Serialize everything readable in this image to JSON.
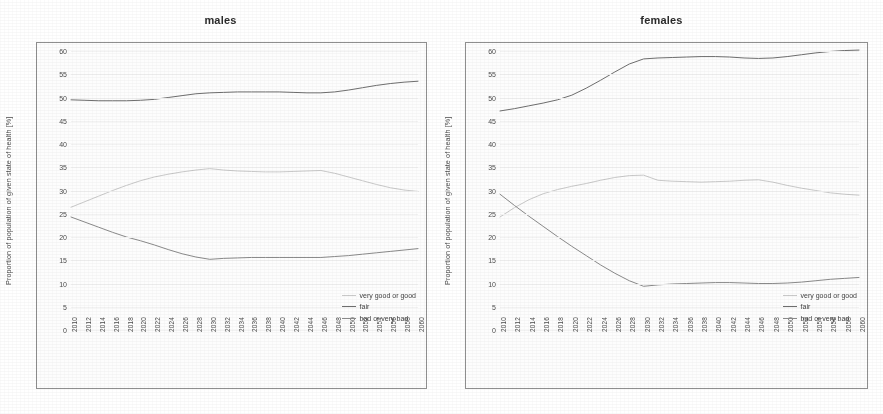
{
  "figure": {
    "background": "#ffffff",
    "panel_count": 2
  },
  "axis": {
    "ylabel": "Proportion of population of given state of health [%]",
    "yticks": [
      0,
      5,
      10,
      15,
      20,
      25,
      30,
      35,
      40,
      45,
      50,
      55,
      60
    ],
    "ylim": [
      0,
      60
    ],
    "xlim": [
      2010,
      2060
    ],
    "xticks": [
      2010,
      2012,
      2014,
      2016,
      2018,
      2020,
      2022,
      2024,
      2026,
      2028,
      2030,
      2032,
      2034,
      2036,
      2038,
      2040,
      2042,
      2044,
      2046,
      2048,
      2050,
      2052,
      2054,
      2056,
      2058,
      2060
    ],
    "grid": true
  },
  "legend": {
    "position": "bottom-right",
    "items": [
      {
        "label": "very good or good",
        "color": "#c9c9c9"
      },
      {
        "label": "fair",
        "color": "#6e6e6e"
      },
      {
        "label": "bad or very bad",
        "color": "#8a8a8a"
      }
    ]
  },
  "chart_data": [
    {
      "type": "line",
      "title": "males",
      "xlabel": "",
      "ylabel": "Proportion of population of given state of health [%]",
      "xlim": [
        2010,
        2060
      ],
      "ylim": [
        0,
        60
      ],
      "grid": true,
      "legend_position": "bottom-right",
      "x": [
        2010,
        2012,
        2014,
        2016,
        2018,
        2020,
        2022,
        2024,
        2026,
        2028,
        2030,
        2032,
        2034,
        2036,
        2038,
        2040,
        2042,
        2044,
        2046,
        2048,
        2050,
        2052,
        2054,
        2056,
        2058,
        2060
      ],
      "series": [
        {
          "name": "very good or good",
          "color": "#c9c9c9",
          "values": [
            26.4,
            27.6,
            28.8,
            30.0,
            31.1,
            32.1,
            32.9,
            33.5,
            34.0,
            34.4,
            34.7,
            34.4,
            34.2,
            34.1,
            34.0,
            34.0,
            34.1,
            34.2,
            34.3,
            33.7,
            32.9,
            32.1,
            31.3,
            30.6,
            30.1,
            29.8
          ]
        },
        {
          "name": "fair",
          "color": "#6e6e6e",
          "values": [
            49.5,
            49.4,
            49.3,
            49.3,
            49.3,
            49.4,
            49.6,
            50.0,
            50.4,
            50.8,
            51.0,
            51.1,
            51.2,
            51.2,
            51.2,
            51.2,
            51.1,
            51.0,
            51.0,
            51.2,
            51.6,
            52.1,
            52.6,
            53.0,
            53.3,
            53.5
          ]
        },
        {
          "name": "bad or very bad",
          "color": "#8a8a8a",
          "values": [
            24.3,
            23.2,
            22.1,
            21.0,
            20.0,
            19.2,
            18.3,
            17.3,
            16.4,
            15.7,
            15.2,
            15.4,
            15.5,
            15.6,
            15.6,
            15.6,
            15.6,
            15.6,
            15.6,
            15.8,
            16.0,
            16.3,
            16.6,
            16.9,
            17.2,
            17.5
          ]
        }
      ]
    },
    {
      "type": "line",
      "title": "females",
      "xlabel": "",
      "ylabel": "Proportion of population of given state of health [%]",
      "xlim": [
        2010,
        2060
      ],
      "ylim": [
        0,
        60
      ],
      "grid": true,
      "legend_position": "bottom-right",
      "x": [
        2010,
        2012,
        2014,
        2016,
        2018,
        2020,
        2022,
        2024,
        2026,
        2028,
        2030,
        2032,
        2034,
        2036,
        2038,
        2040,
        2042,
        2044,
        2046,
        2048,
        2050,
        2052,
        2054,
        2056,
        2058,
        2060
      ],
      "series": [
        {
          "name": "very good or good",
          "color": "#c9c9c9",
          "values": [
            24.3,
            26.3,
            28.0,
            29.3,
            30.2,
            30.9,
            31.5,
            32.2,
            32.8,
            33.2,
            33.3,
            32.2,
            32.0,
            31.9,
            31.8,
            31.9,
            32.0,
            32.2,
            32.3,
            31.8,
            31.1,
            30.5,
            30.0,
            29.5,
            29.2,
            29.0
          ]
        },
        {
          "name": "fair",
          "color": "#6e6e6e",
          "values": [
            47.1,
            47.6,
            48.2,
            48.8,
            49.5,
            50.5,
            52.0,
            53.7,
            55.5,
            57.2,
            58.3,
            58.5,
            58.6,
            58.7,
            58.8,
            58.8,
            58.7,
            58.5,
            58.4,
            58.5,
            58.8,
            59.2,
            59.6,
            59.9,
            60.1,
            60.2
          ]
        },
        {
          "name": "bad or very bad",
          "color": "#8a8a8a",
          "values": [
            29.2,
            26.8,
            24.5,
            22.3,
            20.1,
            18.0,
            16.0,
            14.0,
            12.2,
            10.6,
            9.4,
            9.7,
            9.9,
            10.0,
            10.1,
            10.2,
            10.2,
            10.1,
            10.0,
            10.0,
            10.1,
            10.3,
            10.6,
            10.9,
            11.1,
            11.3
          ]
        }
      ]
    }
  ]
}
